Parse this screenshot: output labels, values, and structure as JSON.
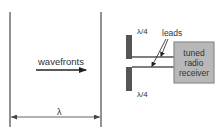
{
  "diagram": {
    "left_panel": {
      "wavefronts_label": "wavefronts",
      "wavelength_label": "λ"
    },
    "right_panel": {
      "upper_element_label": "λ/4",
      "lower_element_label": "λ/4",
      "leads_label": "leads",
      "receiver_box": {
        "line1": "tuned",
        "line2": "radio",
        "line3": "receiver"
      }
    },
    "colors": {
      "line": "#666666",
      "antenna": "#555555",
      "receiver_fill": "#b8b8b8",
      "receiver_border": "#8a8a8a",
      "text": "#333333"
    }
  }
}
